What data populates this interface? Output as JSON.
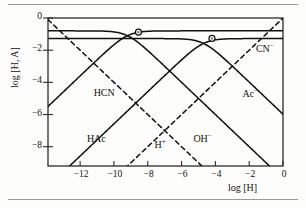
{
  "chart_data": {
    "type": "line",
    "title": "",
    "xlabel": "log [H]",
    "ylabel": "log [H, A]",
    "xlim": [
      -13.9,
      0.0
    ],
    "ylim": [
      -9.2,
      0.0
    ],
    "grid": false,
    "legend": "inline-curve-labels",
    "xticks": [
      -12,
      -10,
      -8,
      -6,
      -4,
      -2,
      0
    ],
    "xtick_labels": [
      "−12",
      "−10",
      "−8",
      "−6",
      "−4",
      "−2",
      "0"
    ],
    "yticks": [
      0,
      -2,
      -4,
      -6,
      -8
    ],
    "ytick_labels": [
      "0",
      "−2",
      "−4",
      "−6",
      "−8"
    ],
    "annotations": [
      {
        "name": "system-point-hcn",
        "x": -8.55,
        "y": -0.88,
        "marker": "circle-dot"
      },
      {
        "name": "system-point-hac",
        "x": -4.2,
        "y": -1.27,
        "marker": "circle-dot"
      }
    ],
    "series": [
      {
        "name": "HCN",
        "label": "HCN",
        "label_html": "HCN",
        "style": "solid",
        "pKa": 9.2,
        "total_log_c": -0.8,
        "label_x": -11.2,
        "label_y": -4.75
      },
      {
        "name": "CN-",
        "label": "CN⁻",
        "label_html": "CN<sup>−</sup>",
        "style": "solid",
        "pKa": 9.2,
        "total_log_c": -0.8,
        "label_x": -1.6,
        "label_y": -1.9
      },
      {
        "name": "HAc",
        "label": "HAc",
        "label_html": "HAc",
        "style": "solid",
        "pKa": 4.7,
        "total_log_c": -1.28,
        "label_x": -11.6,
        "label_y": -7.6
      },
      {
        "name": "Ac-",
        "label": "Ac⁻",
        "label_html": "Ac<sup>−</sup>",
        "style": "solid",
        "pKa": 4.7,
        "total_log_c": -1.28,
        "label_x": -2.4,
        "label_y": -4.75
      },
      {
        "name": "H+",
        "label": "H⁺",
        "label_html": "H<sup>+</sup>",
        "style": "dashed",
        "slope": 1,
        "label_x": -7.6,
        "label_y": -7.9
      },
      {
        "name": "OH-",
        "label": "OH⁻",
        "label_html": "OH<sup>−</sup>",
        "style": "dashed",
        "slope": -1,
        "pKw": 14,
        "label_x": -5.3,
        "label_y": -7.5
      }
    ],
    "colors": {
      "line": "#111111",
      "axis": "#2b2b2b",
      "background": "#fdfdfb",
      "marker_fill": "#8a8a8a"
    }
  },
  "figure": {
    "top_rule": "",
    "bottom_rule": ""
  }
}
